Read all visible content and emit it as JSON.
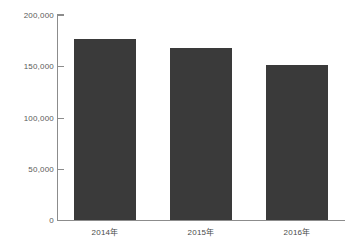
{
  "chart_data": {
    "type": "bar",
    "title": "",
    "subtitle": "",
    "xlabel": "",
    "ylabel": "",
    "categories": [
      "2014年",
      "2015年",
      "2016年"
    ],
    "values": [
      177000,
      168000,
      151000
    ],
    "series": [
      {
        "name": "",
        "values": [
          177000,
          168000,
          151000
        ]
      }
    ],
    "ylim": [
      0,
      200000
    ],
    "ytick_values": [
      0,
      50000,
      100000,
      150000,
      200000
    ],
    "ytick_labels": [
      "0",
      "50,000",
      "100,000",
      "150,000",
      "200,000"
    ],
    "grid": false,
    "legend": false,
    "legend_position": "none",
    "bar_color": "#3a3a3a",
    "axis_color": "#8c8c8c",
    "tick_label_color": "#5a5a5a",
    "background_color": "#ffffff"
  }
}
